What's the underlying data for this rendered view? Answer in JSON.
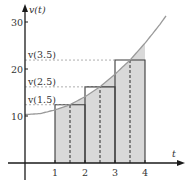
{
  "chart_data": {
    "type": "area",
    "title": "",
    "xlabel": "t",
    "ylabel": "v(t)",
    "xlim": [
      0,
      5.3
    ],
    "ylim": [
      0,
      33
    ],
    "x_ticks": [
      1,
      2,
      3,
      4
    ],
    "y_ticks": [
      10,
      20,
      30
    ],
    "grid": false,
    "legend": null,
    "curve": {
      "name": "v(t)",
      "description": "increasing, concave-up velocity curve",
      "x": [
        0,
        0.5,
        1,
        1.5,
        2,
        2.5,
        3,
        3.5,
        4,
        4.5,
        4.7
      ],
      "y": [
        10.3,
        10.5,
        11.3,
        12.4,
        14.1,
        16.2,
        18.9,
        21.9,
        25.5,
        29.5,
        31.3
      ]
    },
    "shaded_region": {
      "from": 1,
      "to": 4,
      "description": "area under v(t) from t=1 to t=4"
    },
    "rectangles": [
      {
        "x0": 1,
        "x1": 2,
        "height": 12.4,
        "midpoint": 1.5,
        "label": "v(1.5)"
      },
      {
        "x0": 2,
        "x1": 3,
        "height": 16.2,
        "midpoint": 2.5,
        "label": "v(2.5)"
      },
      {
        "x0": 3,
        "x1": 4,
        "height": 21.9,
        "midpoint": 3.5,
        "label": "v(3.5)"
      }
    ],
    "annotations": [
      "v(1.5)",
      "v(2.5)",
      "v(3.5)"
    ]
  },
  "axes": {
    "y_label": "v(t)",
    "x_label": "t",
    "y_tick_labels": [
      "10",
      "20",
      "30"
    ],
    "x_tick_labels": [
      "1",
      "2",
      "3",
      "4"
    ]
  },
  "colors": {
    "shade": "#d9d9d9",
    "curve": "#9a9a9a",
    "rect_stroke": "#3a3a3a",
    "axis": "#1a1a1a",
    "dashed_guides": "#9a9a9a"
  }
}
